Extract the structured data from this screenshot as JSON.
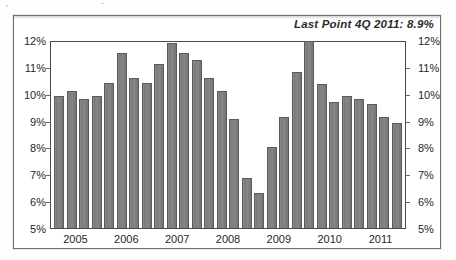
{
  "annotation": "Last Point 4Q 2011: 8.9%",
  "colors": {
    "bar_fill": "#808080",
    "bar_edge": "#5b5b5b",
    "frame": "#4a4a4a",
    "text": "#1f1f1f"
  },
  "chart_data": {
    "type": "bar",
    "title": "",
    "subtitle": "",
    "xlabel": "",
    "ylabel": "",
    "ylim": [
      5,
      12
    ],
    "grid": false,
    "legend": null,
    "y_unit": "%",
    "y_ticks": [
      "5%",
      "6%",
      "7%",
      "8%",
      "9%",
      "10%",
      "11%",
      "12%"
    ],
    "y_tick_values": [
      5,
      6,
      7,
      8,
      9,
      10,
      11,
      12
    ],
    "dual_axis": true,
    "y_ticks_right": [
      "5%",
      "6%",
      "7%",
      "8%",
      "9%",
      "10%",
      "11%",
      "12%"
    ],
    "x_tick_labels": [
      "2005",
      "2006",
      "2007",
      "2008",
      "2009",
      "2010",
      "2011"
    ],
    "categories": [
      "1Q 2005",
      "2Q 2005",
      "3Q 2005",
      "4Q 2005",
      "1Q 2006",
      "2Q 2006",
      "3Q 2006",
      "4Q 2006",
      "1Q 2007",
      "2Q 2007",
      "3Q 2007",
      "4Q 2007",
      "1Q 2008",
      "2Q 2008",
      "3Q 2008",
      "4Q 2008",
      "1Q 2009",
      "2Q 2009",
      "3Q 2009",
      "4Q 2009",
      "1Q 2010",
      "2Q 2010",
      "3Q 2010",
      "4Q 2010",
      "1Q 2011",
      "2Q 2011",
      "3Q 2011",
      "4Q 2011"
    ],
    "values": [
      9.9,
      10.1,
      9.8,
      9.9,
      10.4,
      11.5,
      10.6,
      10.4,
      11.1,
      11.9,
      11.5,
      11.25,
      10.6,
      10.1,
      9.05,
      6.85,
      6.3,
      8.0,
      9.15,
      10.8,
      11.95,
      10.35,
      9.7,
      9.9,
      9.8,
      9.6,
      9.15,
      8.9
    ],
    "annotations": [
      {
        "text": "Last Point 4Q 2011: 8.9%",
        "position": "top-right"
      }
    ]
  }
}
